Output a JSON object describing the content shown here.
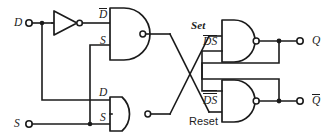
{
  "diagram": {
    "line_color": "#1b1b1b",
    "background": "#ffffff"
  },
  "inputs": [
    {
      "id": "d-input",
      "label": "D"
    },
    {
      "id": "s-input",
      "label": "S"
    }
  ],
  "outputs": [
    {
      "id": "q-output",
      "label": "Q",
      "overbar": false
    },
    {
      "id": "qbar-output",
      "label": "Q",
      "overbar": true
    }
  ],
  "gates": [
    {
      "id": "inverter",
      "type": "NOT",
      "inputs": [
        "D"
      ],
      "output": "Dbar"
    },
    {
      "id": "nand-top-input",
      "type": "NAND",
      "input_labels": [
        "D",
        "S"
      ],
      "input_label_overbars": [
        true,
        false
      ],
      "output_label": "DbarS"
    },
    {
      "id": "nand-bottom-input",
      "type": "NAND",
      "input_labels": [
        "D",
        "S"
      ],
      "input_label_overbars": [
        false,
        false
      ],
      "output_label": "DS"
    },
    {
      "id": "nand-set",
      "type": "NAND",
      "annotation": "Set",
      "input_label_d": "D",
      "input_label_s": "S",
      "overbar_style": "single"
    },
    {
      "id": "nand-reset",
      "type": "NAND",
      "annotation": "Reset",
      "input_label_d": "D",
      "input_label_s": "S",
      "overbar_style": "double"
    }
  ],
  "labels": {
    "d_in": "D",
    "s_in": "S",
    "dbar_wire": "D",
    "s_wire_top": "S",
    "d_wire_bottom": "D",
    "s_wire_bottom": "S",
    "set": "Set",
    "reset": "Reset",
    "ds_top_d": "D",
    "ds_top_s": "S",
    "ds_bottom_d": "D",
    "ds_bottom_s": "S",
    "q": "Q",
    "qbar": "Q"
  }
}
